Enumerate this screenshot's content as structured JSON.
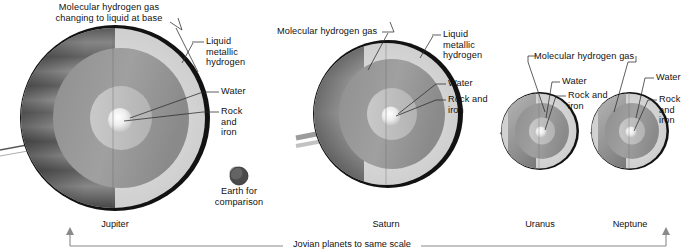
{
  "figure": {
    "caption": "Jovian planets to same scale",
    "scale_bar": {
      "left_arrow": "up-arrow",
      "right_arrow": "up-arrow"
    }
  },
  "planets": [
    {
      "name": "Jupiter",
      "labels": {
        "outer": "Molecular hydrogen gas\nchanging to liquid at base",
        "mantle": "Liquid\nmetallic\nhydrogen",
        "water": "Water",
        "core": "Rock\nand\niron"
      }
    },
    {
      "name": "Saturn",
      "labels": {
        "outer": "Molecular hydrogen gas",
        "mantle": "Liquid\nmetallic\nhydrogen",
        "water": "Water",
        "core": "Rock and\niron"
      }
    },
    {
      "name": "Uranus",
      "labels": {
        "outer": "Molecular hydrogen gas",
        "water": "Water",
        "core": "Rock and\niron"
      }
    },
    {
      "name": "Neptune",
      "labels": {
        "water": "Water",
        "core": "Rock\nand\niron"
      }
    }
  ],
  "earth": {
    "label": "Earth for\ncomparison"
  },
  "colors": {
    "background": "#ffffff",
    "text": "#111111",
    "leader_line": "#2a2a2a",
    "scale_rule": "#8a8a8a",
    "shell_outer": "#d9d9d9",
    "shell_mantle": "#9a9a9a",
    "shell_water": "#c3c3c3",
    "core": "#f2f2f2",
    "limb": "#121212"
  }
}
